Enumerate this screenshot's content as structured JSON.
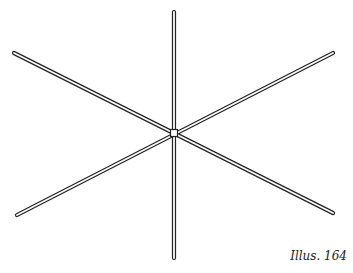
{
  "figure": {
    "caption": "Illus. 164",
    "stroke_color": "#222222",
    "background": "#ffffff",
    "center": [
      174,
      133
    ],
    "rods": [
      {
        "name": "vertical-rod",
        "x1": 174,
        "y1": 12,
        "x2": 174,
        "y2": 258
      },
      {
        "name": "diagonal-rod-down",
        "x1": 14,
        "y1": 53,
        "x2": 333,
        "y2": 213
      },
      {
        "name": "diagonal-rod-up",
        "x1": 333,
        "y1": 53,
        "x2": 17,
        "y2": 215
      }
    ]
  }
}
